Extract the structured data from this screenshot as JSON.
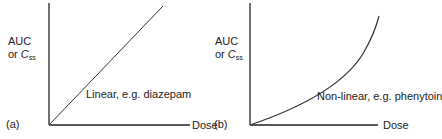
{
  "panels": [
    {
      "id": "a",
      "panel_label": "(a)",
      "y_label_line1": "AUC",
      "y_label_line2_prefix": "or ",
      "y_label_var": "C",
      "y_label_sub": "ss",
      "x_label": "Dose",
      "curve_label": "Linear, e.g. diazepam"
    },
    {
      "id": "b",
      "panel_label": "(b)",
      "y_label_line1": "AUC",
      "y_label_line2_prefix": "or ",
      "y_label_var": "C",
      "y_label_sub": "ss",
      "x_label": "Dose",
      "curve_label": "Non-linear, e.g. phenytoin"
    }
  ],
  "colors": {
    "axis": "#222222",
    "curve": "#333333",
    "text": "#222222"
  }
}
